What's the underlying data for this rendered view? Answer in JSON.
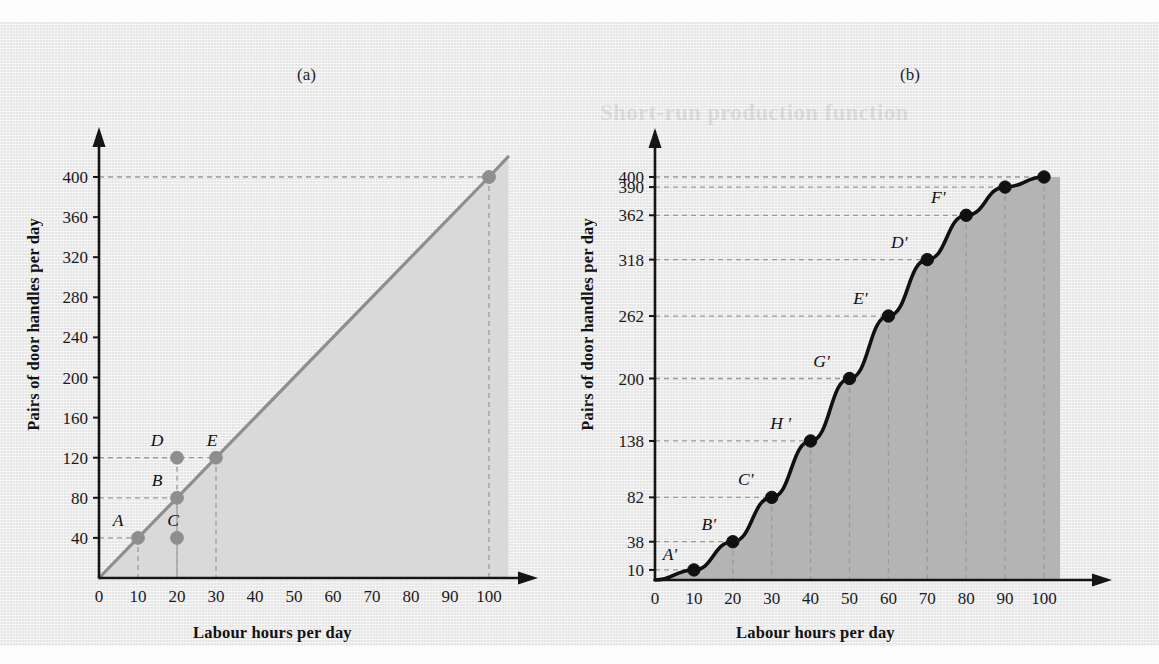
{
  "figure": {
    "panel_label_a": "(a)",
    "panel_label_b": "(b)",
    "bleed_top_text": "production function type",
    "bleed_right_text": "Short-run production function"
  },
  "chart_data": [
    {
      "id": "a",
      "type": "line",
      "title": "(a)",
      "xlabel": "Labour hours per day",
      "ylabel": "Pairs of door handles per day",
      "xlim": [
        0,
        105
      ],
      "ylim": [
        0,
        420
      ],
      "xticks": [
        0,
        10,
        20,
        30,
        40,
        50,
        60,
        70,
        80,
        90,
        100
      ],
      "yticks": [
        40,
        80,
        120,
        160,
        200,
        240,
        280,
        320,
        360,
        400
      ],
      "grid": "dashed-guides-only",
      "legend": "none",
      "line_color": "#8e8e8e",
      "fill_color": "#d9d9d9",
      "series": [
        {
          "name": "Total product (linear)",
          "x": [
            0,
            10,
            20,
            30,
            100
          ],
          "values": [
            0,
            40,
            80,
            120,
            400
          ]
        }
      ],
      "points": [
        {
          "label": "A",
          "x": 10,
          "y": 40,
          "label_dx": -20,
          "label_dy": -12
        },
        {
          "label": "B",
          "x": 20,
          "y": 80,
          "label_dx": -20,
          "label_dy": -12
        },
        {
          "label": "C",
          "x": 20,
          "y": 40,
          "label_dx": -4,
          "label_dy": -12
        },
        {
          "label": "D",
          "x": 20,
          "y": 120,
          "label_dx": -20,
          "label_dy": -12
        },
        {
          "label": "E",
          "x": 30,
          "y": 120,
          "label_dx": -4,
          "label_dy": -12
        },
        {
          "label": "",
          "x": 100,
          "y": 400,
          "label_dx": 0,
          "label_dy": 0
        }
      ],
      "guides": [
        {
          "x": 10,
          "y": 40
        },
        {
          "x": 20,
          "y": 80
        },
        {
          "x": 20,
          "y": 120
        },
        {
          "x": 30,
          "y": 120
        },
        {
          "x": 100,
          "y": 400
        }
      ]
    },
    {
      "id": "b",
      "type": "line",
      "title": "(b)",
      "xlabel": "Labour hours per day",
      "ylabel": "Pairs of door handles per day",
      "xlim": [
        0,
        105
      ],
      "ylim": [
        0,
        420
      ],
      "xticks": [
        0,
        10,
        20,
        30,
        40,
        50,
        60,
        70,
        80,
        90,
        100
      ],
      "yticks": [
        10,
        38,
        82,
        138,
        200,
        262,
        318,
        362,
        390,
        400
      ],
      "grid": "dashed-guides-only",
      "legend": "none",
      "line_color": "#101010",
      "fill_color": "#b4b4b4",
      "series": [
        {
          "name": "Total product (S-shaped)",
          "x": [
            0,
            10,
            20,
            30,
            40,
            50,
            60,
            70,
            80,
            90,
            100
          ],
          "values": [
            0,
            10,
            38,
            82,
            138,
            200,
            262,
            318,
            362,
            390,
            400
          ]
        }
      ],
      "points": [
        {
          "label": "A'",
          "x": 10,
          "y": 10,
          "label_dx": -24,
          "label_dy": -10
        },
        {
          "label": "B'",
          "x": 20,
          "y": 38,
          "label_dx": -24,
          "label_dy": -12
        },
        {
          "label": "C'",
          "x": 30,
          "y": 82,
          "label_dx": -26,
          "label_dy": -12
        },
        {
          "label": "H '",
          "x": 40,
          "y": 138,
          "label_dx": -30,
          "label_dy": -12
        },
        {
          "label": "G'",
          "x": 50,
          "y": 200,
          "label_dx": -28,
          "label_dy": -12
        },
        {
          "label": "E'",
          "x": 60,
          "y": 262,
          "label_dx": -28,
          "label_dy": -12
        },
        {
          "label": "D'",
          "x": 70,
          "y": 318,
          "label_dx": -28,
          "label_dy": -12
        },
        {
          "label": "F'",
          "x": 80,
          "y": 362,
          "label_dx": -28,
          "label_dy": -12
        },
        {
          "label": "",
          "x": 90,
          "y": 390,
          "label_dx": 0,
          "label_dy": 0
        },
        {
          "label": "",
          "x": 100,
          "y": 400,
          "label_dx": 0,
          "label_dy": 0
        }
      ],
      "guides": [
        {
          "x": 10,
          "y": 10
        },
        {
          "x": 20,
          "y": 38
        },
        {
          "x": 30,
          "y": 82
        },
        {
          "x": 40,
          "y": 138
        },
        {
          "x": 50,
          "y": 200
        },
        {
          "x": 60,
          "y": 262
        },
        {
          "x": 70,
          "y": 318
        },
        {
          "x": 80,
          "y": 362
        },
        {
          "x": 90,
          "y": 390
        },
        {
          "x": 100,
          "y": 400
        }
      ]
    }
  ]
}
